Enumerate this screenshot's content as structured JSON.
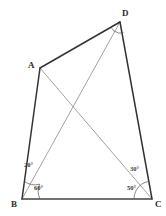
{
  "figure": {
    "background_color": "#ffffff",
    "stroke_dark": "#333333",
    "stroke_light": "#8a8a8a",
    "label_color": "#2b2b2b",
    "width": 166,
    "height": 216,
    "vertices": [
      {
        "name": "A",
        "label": "A",
        "x": 40,
        "y": 68,
        "label_x": 28,
        "label_y": 61
      },
      {
        "name": "B",
        "label": "B",
        "x": 22,
        "y": 199,
        "label_x": 11,
        "label_y": 200
      },
      {
        "name": "C",
        "label": "C",
        "x": 152,
        "y": 199,
        "label_x": 155,
        "label_y": 200
      },
      {
        "name": "D",
        "label": "D",
        "x": 120,
        "y": 22,
        "label_x": 122,
        "label_y": 9
      }
    ],
    "sides": [
      {
        "name": "side-ab",
        "from": "A",
        "to": "B",
        "weight": "heavy"
      },
      {
        "name": "side-ad",
        "from": "A",
        "to": "D",
        "weight": "heavy"
      },
      {
        "name": "side-dc",
        "from": "D",
        "to": "C",
        "weight": "heavy"
      },
      {
        "name": "side-bc",
        "from": "B",
        "to": "C",
        "weight": "heavy"
      }
    ],
    "diagonals": [
      {
        "name": "diagonal-ac",
        "from": "A",
        "to": "C",
        "weight": "light"
      },
      {
        "name": "diagonal-bd",
        "from": "B",
        "to": "D",
        "weight": "light"
      }
    ],
    "intersection": {
      "name": "diagonal-intersection",
      "x": 72,
      "y": 108
    },
    "angles": [
      {
        "name": "angle-abd",
        "value": "20",
        "unit": "°",
        "text": "20°",
        "vertex": "B",
        "label_x": 24,
        "label_y": 162
      },
      {
        "name": "angle-dbc",
        "value": "60",
        "unit": "°",
        "text": "60°",
        "vertex": "B",
        "label_x": 34,
        "label_y": 185
      },
      {
        "name": "angle-acd",
        "value": "30",
        "unit": "°",
        "text": "30°",
        "vertex": "C",
        "label_x": 130,
        "label_y": 166
      },
      {
        "name": "angle-bca",
        "value": "50",
        "unit": "°",
        "text": "50°",
        "vertex": "C",
        "label_x": 127,
        "label_y": 185
      }
    ]
  }
}
